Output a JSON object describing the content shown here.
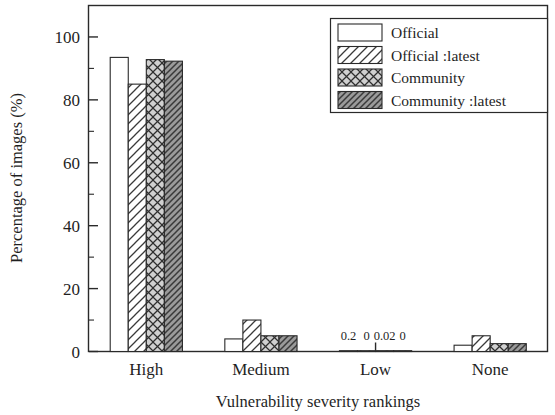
{
  "chart_data": {
    "type": "bar",
    "title": "",
    "xlabel": "Vulnerability severity rankings",
    "ylabel": "Percentage of images (%)",
    "categories": [
      "High",
      "Medium",
      "Low",
      "None"
    ],
    "ylim": [
      0,
      110
    ],
    "ytick_labels": [
      "0",
      "20",
      "40",
      "60",
      "80",
      "100"
    ],
    "ytick_values": [
      0,
      20,
      40,
      60,
      80,
      100
    ],
    "yminor_values": [
      10,
      30,
      50,
      70,
      90
    ],
    "grid": false,
    "legend_position": "top-right",
    "series": [
      {
        "name": "Official",
        "pattern": "empty",
        "values": [
          93.5,
          4.0,
          0.2,
          2.0
        ],
        "labels": [
          "",
          "",
          "0.2",
          ""
        ]
      },
      {
        "name": "Official :latest",
        "pattern": "diagonal-forward",
        "values": [
          85.0,
          10.0,
          0.0,
          5.0
        ],
        "labels": [
          "",
          "",
          "0",
          ""
        ]
      },
      {
        "name": "Community",
        "pattern": "cross-hatch",
        "values": [
          92.8,
          5.0,
          0.02,
          2.5
        ],
        "labels": [
          "",
          "",
          "0.02",
          ""
        ]
      },
      {
        "name": "Community :latest",
        "pattern": "dense-diagonal-back",
        "values": [
          92.3,
          5.0,
          0.0,
          2.5
        ],
        "labels": [
          "",
          "",
          "0",
          ""
        ]
      }
    ]
  },
  "legend": {
    "items": [
      {
        "label": "Official"
      },
      {
        "label": "Official :latest"
      },
      {
        "label": "Community"
      },
      {
        "label": "Community :latest"
      }
    ]
  },
  "colors": {
    "axis": "#2a2a2a",
    "text": "#1f1f1f",
    "background": "#ffffff",
    "series_empty_fill": "#ffffff",
    "series_hatch_fill": "#ffffff",
    "series_cross_fill": "#d0d0d0",
    "series_dense_fill": "#9a9a9a"
  }
}
